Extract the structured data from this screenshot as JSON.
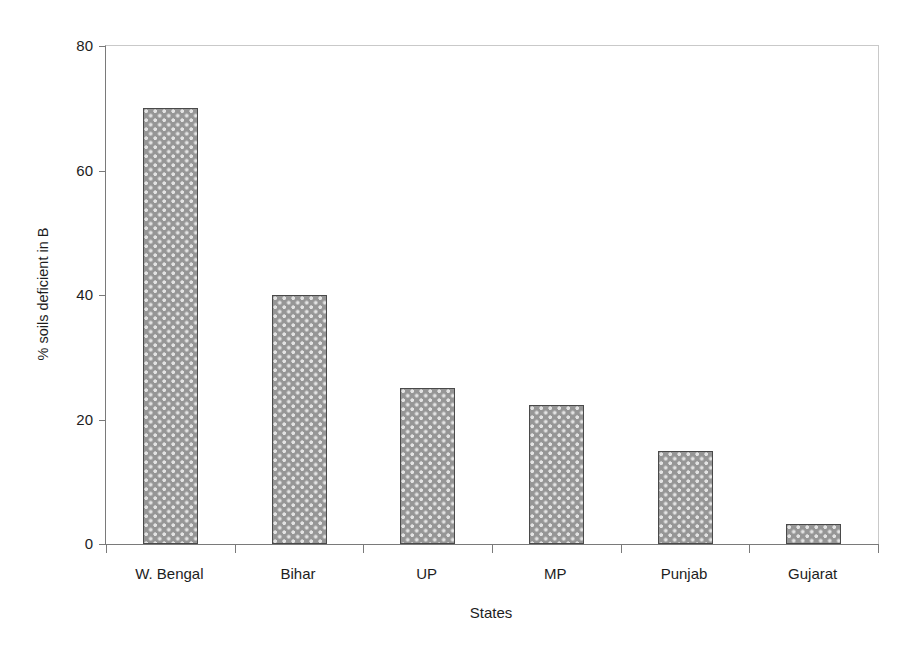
{
  "chart_data": {
    "type": "bar",
    "title": "",
    "subtitle": "",
    "xlabel": "States",
    "ylabel": "% soils deficient in B",
    "categories": [
      "W. Bengal",
      "Bihar",
      "UP",
      "MP",
      "Punjab",
      "Gujarat"
    ],
    "values": [
      70,
      40,
      25,
      22.3,
      15,
      3.2
    ],
    "series": [
      {
        "name": "% soils deficient in B",
        "values": [
          70,
          40,
          25,
          22.3,
          15,
          3.2
        ]
      }
    ],
    "ylim": [
      0,
      80
    ],
    "yticks": [
      0,
      20,
      40,
      60,
      80
    ],
    "ytick_labels": [
      "0",
      "20",
      "40",
      "60",
      "80"
    ],
    "grid": false,
    "legend": false,
    "legend_position": "none",
    "bar_fill_color": "#969696",
    "bar_pattern": "light-dotted-stipple",
    "bar_edge_color": "#4a4a4a",
    "axis_color": "#7a7a7a",
    "background_color": "#ffffff",
    "annotations": []
  },
  "axes": {
    "y": {
      "title": "% soils deficient in B",
      "ticks": [
        {
          "value": 80,
          "label": "80"
        },
        {
          "value": 60,
          "label": "60"
        },
        {
          "value": 40,
          "label": "40"
        },
        {
          "value": 20,
          "label": "20"
        },
        {
          "value": 0,
          "label": "0"
        }
      ]
    },
    "x": {
      "title": "States",
      "categories": [
        {
          "label": "W. Bengal",
          "value": 70
        },
        {
          "label": "Bihar",
          "value": 40
        },
        {
          "label": "UP",
          "value": 25
        },
        {
          "label": "MP",
          "value": 22.3
        },
        {
          "label": "Punjab",
          "value": 15
        },
        {
          "label": "Gujarat",
          "value": 3.2
        }
      ]
    }
  }
}
